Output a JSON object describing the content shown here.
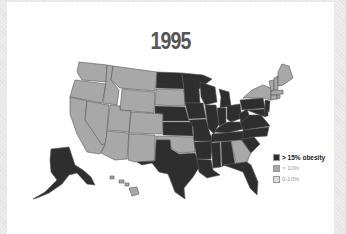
{
  "title": "1995",
  "colors": {
    "high": "#2e2e2e",
    "mid": "#a8a8a8",
    "low": "#d9d9d9",
    "border": "#555555",
    "panel": "#ffffff",
    "frame": "#e8e8e8"
  },
  "legend": {
    "items": [
      {
        "key": "high",
        "label": "> 15% obesity"
      },
      {
        "key": "mid",
        "label": "> 10%"
      },
      {
        "key": "low",
        "label": "0-10%"
      }
    ]
  },
  "chart_data": {
    "type": "choropleth",
    "title": "1995",
    "region": "United States",
    "legend": [
      "> 15% obesity",
      "> 10%",
      "0-10%"
    ],
    "categories": {
      "> 15% obesity": [
        "ND",
        "MN",
        "WI",
        "MI",
        "IA",
        "NE",
        "KS",
        "MO",
        "IL",
        "IN",
        "OH",
        "KY",
        "TN",
        "AR",
        "LA",
        "MS",
        "AL",
        "TX",
        "FL",
        "SC",
        "NC",
        "VA",
        "WV",
        "PA",
        "MD",
        "DE",
        "NJ",
        "AK"
      ],
      "> 10%": [
        "WA",
        "OR",
        "CA",
        "NV",
        "ID",
        "MT",
        "WY",
        "UT",
        "CO",
        "AZ",
        "NM",
        "SD",
        "OK",
        "GA",
        "NY",
        "VT",
        "NH",
        "ME",
        "MA",
        "CT",
        "RI",
        "HI"
      ],
      "0-10%": []
    }
  }
}
